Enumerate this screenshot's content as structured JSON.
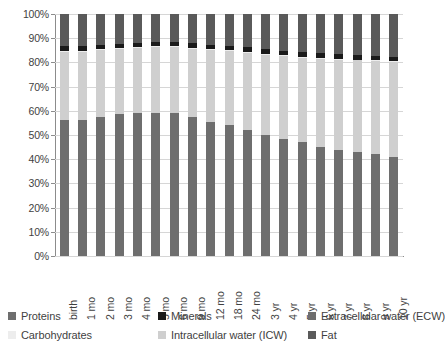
{
  "chart_data": {
    "type": "bar",
    "subtype": "stacked-bar-100-percent",
    "title": "",
    "xlabel": "",
    "ylabel": "",
    "ylim": [
      0,
      100
    ],
    "ytick_labels": [
      "100%",
      "90%",
      "80%",
      "70%",
      "60%",
      "50%",
      "40%",
      "30%",
      "20%",
      "10%",
      "0%"
    ],
    "ytick_values": [
      100,
      90,
      80,
      70,
      60,
      50,
      40,
      30,
      20,
      10,
      0
    ],
    "grid": true,
    "legend_position": "bottom",
    "categories": [
      "birth",
      "1 mo",
      "2 mo",
      "3 mo",
      "4 mo",
      "5 mo",
      "6 mo",
      "9 mo",
      "12 mo",
      "18 mo",
      "24 mo",
      "3 yr",
      "4 yr",
      "5 yr",
      "6 yr",
      "7 yr",
      "8 yr",
      "9 yr",
      "10 yr"
    ],
    "series": [
      {
        "name": "Extracellular water (ECW)",
        "color": "#6e6e6e",
        "values": [
          56.0,
          56.0,
          57.5,
          58.5,
          59.0,
          59.0,
          59.0,
          57.5,
          55.5,
          54.0,
          52.0,
          50.0,
          48.5,
          47.0,
          45.0,
          44.0,
          43.0,
          42.0,
          41.0
        ]
      },
      {
        "name": "Intracellular water (ICW)",
        "color": "#cfcfcf",
        "values": [
          28.5,
          28.5,
          27.5,
          27.0,
          27.0,
          27.2,
          27.2,
          28.2,
          29.6,
          30.6,
          32.0,
          33.2,
          34.0,
          35.0,
          36.5,
          37.2,
          37.8,
          38.5,
          39.0
        ]
      },
      {
        "name": "Minerals",
        "color": "#1a1a1a",
        "values": [
          1.7,
          1.8,
          1.8,
          1.8,
          1.8,
          1.8,
          1.8,
          1.8,
          1.8,
          1.8,
          1.8,
          1.8,
          1.8,
          1.8,
          1.8,
          1.8,
          1.8,
          1.8,
          1.8
        ]
      },
      {
        "name": "Carbohydrates",
        "color": "#ededed",
        "values": [
          0.4,
          0.4,
          0.4,
          0.4,
          0.4,
          0.4,
          0.4,
          0.4,
          0.4,
          0.4,
          0.4,
          0.4,
          0.4,
          0.4,
          0.4,
          0.4,
          0.4,
          0.4,
          0.4
        ]
      },
      {
        "name": "Proteins",
        "color": "#6e6e6e",
        "values": [
          0.0,
          0.0,
          0.0,
          0.0,
          0.0,
          0.0,
          0.0,
          0.0,
          0.0,
          0.0,
          0.0,
          0.0,
          0.0,
          0.0,
          0.0,
          0.0,
          0.0,
          0.0,
          0.0
        ]
      },
      {
        "name": "Fat",
        "color": "#5a5a5a",
        "values": [
          13.4,
          13.3,
          12.8,
          12.3,
          11.8,
          11.6,
          11.6,
          12.1,
          12.7,
          13.2,
          13.8,
          14.6,
          15.3,
          15.8,
          16.3,
          16.6,
          17.0,
          17.3,
          17.8
        ]
      }
    ]
  },
  "legend": {
    "items": [
      {
        "label": "Proteins",
        "color": "#6e6e6e",
        "row": 0,
        "col": 0
      },
      {
        "label": "Minerals",
        "color": "#1a1a1a",
        "row": 0,
        "col": 1
      },
      {
        "label": "Extracellular water (ECW)",
        "color": "#6e6e6e",
        "row": 0,
        "col": 2
      },
      {
        "label": "Carbohydrates",
        "color": "#ededed",
        "row": 1,
        "col": 0
      },
      {
        "label": "Intracellular water (ICW)",
        "color": "#cfcfcf",
        "row": 1,
        "col": 1
      },
      {
        "label": "Fat",
        "color": "#5a5a5a",
        "row": 1,
        "col": 2
      }
    ]
  },
  "colors": {
    "grid": "#d6d6d6",
    "axis": "#8c8c8c",
    "text": "#3f3f3f",
    "background": "#ffffff"
  }
}
